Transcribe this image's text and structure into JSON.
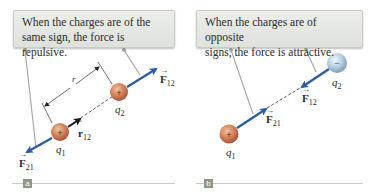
{
  "panels": [
    {
      "id": "a",
      "caption": "When the charges are of the same sign, the force is repulsive.",
      "caption_lines": [
        "When the charges are of the",
        "same sign, the force is repulsive."
      ],
      "label": "a",
      "charges": [
        {
          "name": "q1",
          "symbol": "q",
          "subscript": "1",
          "sign": "+",
          "color": "#d4825a"
        },
        {
          "name": "q2",
          "symbol": "q",
          "subscript": "2",
          "sign": "+",
          "color": "#d4825a"
        }
      ],
      "vectors": [
        {
          "name": "F12",
          "base": "F",
          "subscript": "12"
        },
        {
          "name": "F21",
          "base": "F",
          "subscript": "21"
        },
        {
          "name": "r12-hat",
          "base": "r",
          "subscript": "12",
          "hat": true
        }
      ],
      "distance_label": "r"
    },
    {
      "id": "b",
      "caption": "When the charges are of opposite signs, the force is attractive.",
      "caption_lines": [
        "When the charges are of opposite",
        "signs, the force is attractive."
      ],
      "label": "b",
      "charges": [
        {
          "name": "q1",
          "symbol": "q",
          "subscript": "1",
          "sign": "+",
          "color": "#d4825a"
        },
        {
          "name": "q2",
          "symbol": "q",
          "subscript": "2",
          "sign": "−",
          "color": "#a9c3d8"
        }
      ],
      "vectors": [
        {
          "name": "F12",
          "base": "F",
          "subscript": "12"
        },
        {
          "name": "F21",
          "base": "F",
          "subscript": "21"
        }
      ]
    }
  ],
  "colors": {
    "force_arrow": "#2a5aa0",
    "unit_vector_arrow": "#1a1a1a",
    "positive_charge": "#d4825a",
    "negative_charge": "#a9c3d8",
    "caption_bg": "#e6e8e3",
    "panel_label_bg": "#8e9985"
  }
}
